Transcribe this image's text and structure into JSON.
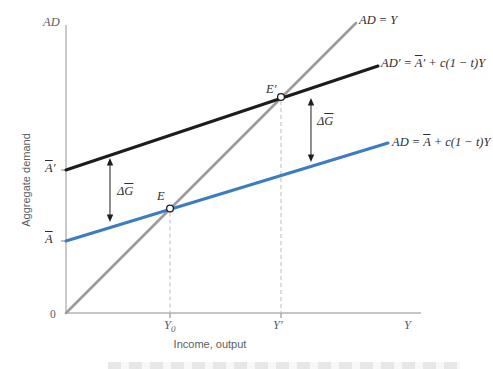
{
  "figure": {
    "y_axis_symbol": "AD",
    "y_axis_title": "Aggregate demand",
    "x_axis_title": "Income, output",
    "origin_label": "0",
    "x_end_label": "Y"
  },
  "labels": {
    "y0": {
      "base": "Y",
      "sub": "0"
    },
    "y_prime": "Y′",
    "a_bar_prime": {
      "bar": "A",
      "post": "′"
    },
    "a_bar": {
      "bar": "A"
    },
    "line45": "AD = Y",
    "ad_new": {
      "pre": "AD′ = ",
      "bar": "A",
      "post": "′ + c(1 − t)Y"
    },
    "ad_old": {
      "pre": "AD = ",
      "bar": "A",
      "post": " + c(1 − t)Y"
    },
    "delta_g": {
      "pre": "Δ",
      "bar": "G"
    },
    "e": "E",
    "e_prime": "E′"
  },
  "colors": {
    "line_45deg": "#9c9c9c",
    "ad_new_line": "#1c1c1c",
    "ad_old_line": "#3d7cc0",
    "axis": "#b3b3b3",
    "tick": "#9a9a9a",
    "dashed_guide": "#c6c6c6",
    "axis_text": "#5b5e62",
    "math_text": "#2e2e2e"
  },
  "chart_data": {
    "type": "line",
    "xlabel": "Income, output",
    "ylabel": "Aggregate demand",
    "x_range": [
      0,
      1
    ],
    "y_range": [
      0,
      1
    ],
    "grid": false,
    "lines": [
      {
        "name": "45-degree",
        "label": "AD = Y",
        "color": "#9c9c9c",
        "width": 2.6,
        "x": [
          0,
          0.8169
        ],
        "y": [
          0,
          1.0069
        ]
      },
      {
        "name": "ad-new",
        "label": "AD′ = A̅′ + c(1 − t)Y",
        "color": "#1c1c1c",
        "width": 3,
        "x": [
          0,
          0.8789
        ],
        "y": [
          0.4965,
          0.8576
        ]
      },
      {
        "name": "ad-initial",
        "label": "AD = A̅ + c(1 − t)Y",
        "color": "#3d7cc0",
        "width": 3,
        "x": [
          0,
          0.907
        ],
        "y": [
          0.25,
          0.5903
        ]
      }
    ],
    "points": [
      {
        "name": "E",
        "label": "E",
        "x": 0.293,
        "y": 0.3628
      },
      {
        "name": "E-prime",
        "label": "E′",
        "x": 0.6056,
        "y": 0.75
      }
    ],
    "guides": [
      {
        "name": "Y0",
        "x": 0.293,
        "y_top": 0.3628
      },
      {
        "name": "Y-prime",
        "x": 0.6056,
        "y_top": 0.75
      }
    ],
    "arrows": [
      {
        "name": "delta-G-left",
        "label": "ΔG̅",
        "x": 0.1239,
        "y_top": 0.5382,
        "y_bottom": 0.316
      },
      {
        "name": "delta-G-right",
        "label": "ΔG̅",
        "x": 0.6901,
        "y_top": 0.7465,
        "y_bottom": 0.5243
      }
    ],
    "x_ticks": [
      {
        "label": "Y₀",
        "x": 0.293
      },
      {
        "label": "Y′",
        "x": 0.6056
      }
    ],
    "y_ticks": [
      {
        "label": "A̅′",
        "y": 0.4965
      },
      {
        "label": "A̅",
        "y": 0.25
      }
    ]
  }
}
